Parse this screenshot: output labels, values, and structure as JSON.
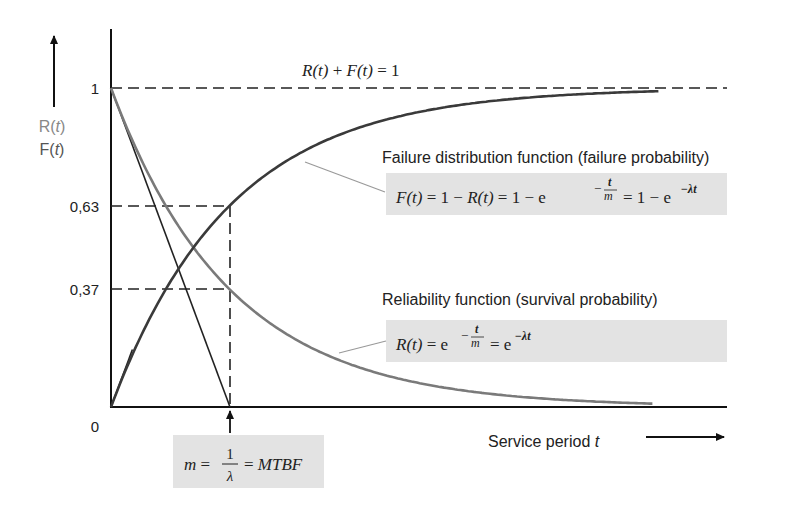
{
  "chart_data": {
    "type": "line",
    "title": "",
    "xlabel": "Service period t",
    "ylabel_top": "R(t)",
    "ylabel_bottom": "F(t)",
    "ylim": [
      0,
      1
    ],
    "xlim_in_m_units": [
      0,
      4.6
    ],
    "y_ticks": [
      {
        "value": 1,
        "label": "1"
      },
      {
        "value": 0.63,
        "label": "0,63"
      },
      {
        "value": 0.37,
        "label": "0,37"
      },
      {
        "value": 0,
        "label": "0"
      }
    ],
    "mtbf_m": 1,
    "series": [
      {
        "name": "Reliability function (survival probability)",
        "formula": "R(t) = e^(-t/m) = e^(-λt)",
        "color": "#7a7a7a",
        "t_max_m": 4.55
      },
      {
        "name": "Failure distribution function (failure probability)",
        "formula": "F(t) = 1 - R(t) = 1 - e^(-t/m) = 1 - e^(-λt)",
        "color": "#3a3a3a",
        "t_max_m": 4.6
      }
    ],
    "annotations": {
      "sum_identity": "R(t) + F(t) = 1",
      "failure_title": "Failure distribution function (failure probability)",
      "reliability_title": "Reliability function (survival probability)",
      "mtbf_label": "m = 1/λ = MTBF"
    },
    "grid": false,
    "legend": "none"
  }
}
